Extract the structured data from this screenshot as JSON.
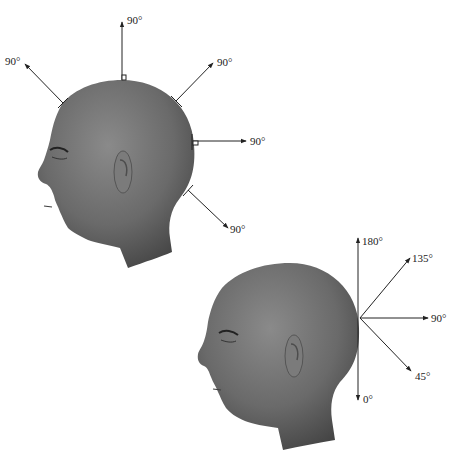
{
  "figure": {
    "caption_fragment": "",
    "panel_a": {
      "description": "Head with arrows perpendicular to the scalp at several points",
      "arrows": [
        {
          "id": "top",
          "label": "90°"
        },
        {
          "id": "upper-left",
          "label": "90°"
        },
        {
          "id": "upper-right",
          "label": "90°"
        },
        {
          "id": "right",
          "label": "90°"
        },
        {
          "id": "lower-right",
          "label": "90°"
        }
      ]
    },
    "panel_b": {
      "description": "Head with fan of elevation angles from a single scalp point",
      "arrows": [
        {
          "id": "a180",
          "label": "180°"
        },
        {
          "id": "a135",
          "label": "135°"
        },
        {
          "id": "a90",
          "label": "90°"
        },
        {
          "id": "a45",
          "label": "45°"
        },
        {
          "id": "a0",
          "label": "0°"
        }
      ]
    },
    "colors": {
      "head_dark": "#4a4a4a",
      "head_mid": "#6e6e6e",
      "head_light": "#8c8c8c",
      "line": "#222222"
    }
  }
}
